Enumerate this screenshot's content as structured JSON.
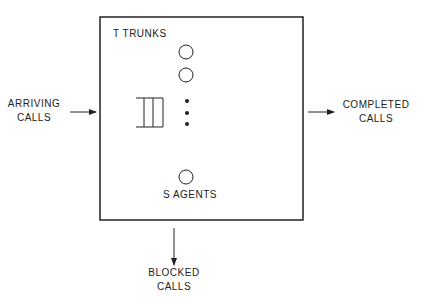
{
  "diagram": {
    "system_box": {
      "trunks_label": "T TRUNKS",
      "agents_label": "S AGENTS"
    },
    "inputs": {
      "arriving_line1": "ARRIVING",
      "arriving_line2": "CALLS"
    },
    "outputs": {
      "completed_line1": "COMPLETED",
      "completed_line2": "CALLS",
      "blocked_line1": "BLOCKED",
      "blocked_line2": "CALLS"
    },
    "colors": {
      "stroke": "#222222",
      "background": "#ffffff"
    }
  }
}
